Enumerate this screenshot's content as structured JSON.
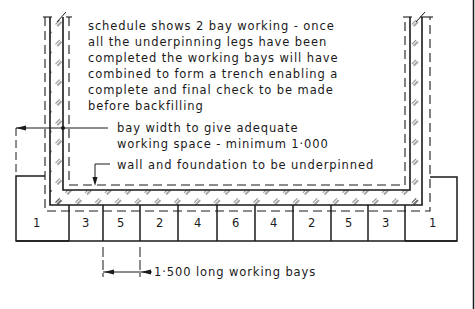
{
  "diagram": {
    "title_note": {
      "lines": [
        "schedule shows 2 bay working - once",
        "all the underpinning  legs have been",
        "completed  the working  bays will have",
        "combined to form a trench  enabling a",
        "complete and final check  to be made",
        "before  backfilling"
      ]
    },
    "annotations": {
      "bay_width": {
        "line1": "bay width to give adequate",
        "line2": "working space - minimum 1·000"
      },
      "wall_label": "wall and foundation to be underpinned",
      "bay_length": "1·500  long  working  bays"
    },
    "bays": [
      {
        "label": "1",
        "role": "left-end"
      },
      {
        "label": "3"
      },
      {
        "label": "5"
      },
      {
        "label": "2"
      },
      {
        "label": "4"
      },
      {
        "label": "6"
      },
      {
        "label": "4"
      },
      {
        "label": "2"
      },
      {
        "label": "5"
      },
      {
        "label": "3"
      },
      {
        "label": "1",
        "role": "right-end"
      }
    ],
    "colors": {
      "ink": "#1a1a1a",
      "paper": "#ffffff"
    }
  }
}
